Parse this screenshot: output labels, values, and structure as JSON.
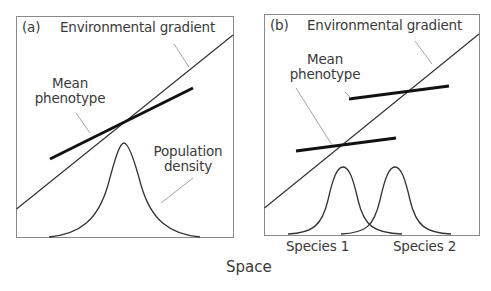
{
  "figure": {
    "x_axis_label": "Space",
    "panels": [
      {
        "id": "a",
        "panel_label": "(a)",
        "labels": {
          "environmental_gradient": "Environmental gradient",
          "mean_phenotype_line1": "Mean",
          "mean_phenotype_line2": "phenotype",
          "population_density_line1": "Population",
          "population_density_line2": "density"
        }
      },
      {
        "id": "b",
        "panel_label": "(b)",
        "labels": {
          "environmental_gradient": "Environmental gradient",
          "mean_phenotype_line1": "Mean",
          "mean_phenotype_line2": "phenotype",
          "species_1": "Species 1",
          "species_2": "Species 2"
        }
      }
    ]
  },
  "colors": {
    "frame": "#8a8a8a",
    "thin_line": "#333333",
    "thick_line": "#111111",
    "leader": "#9a9a9a",
    "text": "#3a3a3a"
  }
}
